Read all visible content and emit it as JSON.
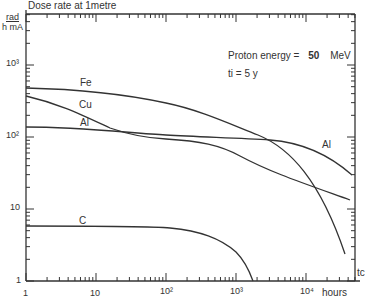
{
  "chart_data": {
    "type": "line",
    "ylabel_num": "rad",
    "ylabel_den": "h mA",
    "xlabel": "hours",
    "x_end_label": "t_c",
    "xscale": "log",
    "yscale": "log",
    "xlim": [
      1,
      40000
    ],
    "ylim": [
      1,
      2000
    ],
    "x_ticks": [
      "1",
      "10",
      "10^2",
      "10^3",
      "10^4"
    ],
    "y_ticks": [
      "1",
      "10",
      "10^2",
      "10^3"
    ],
    "annotations": [
      "Proton energy = 50 MeV",
      "t_i = 5 y"
    ],
    "series": [
      {
        "name": "Fe",
        "x": [
          1,
          10,
          100,
          1000,
          3000,
          10000,
          20000,
          35000
        ],
        "y": [
          480,
          440,
          330,
          170,
          110,
          55,
          15,
          2.5
        ]
      },
      {
        "name": "Cu",
        "x": [
          1,
          10,
          30,
          100,
          1000,
          3000,
          10000,
          20000,
          35000
        ],
        "y": [
          380,
          230,
          150,
          110,
          90,
          55,
          30,
          22,
          17
        ]
      },
      {
        "name": "Al",
        "x": [
          1,
          10,
          100,
          1000,
          3000,
          10000,
          20000,
          35000
        ],
        "y": [
          140,
          135,
          115,
          105,
          100,
          70,
          45,
          27
        ]
      },
      {
        "name": "C",
        "x": [
          1,
          10,
          100,
          500,
          1000,
          2000,
          2600
        ],
        "y": [
          6,
          6,
          5.8,
          4.5,
          3.2,
          1.6,
          1
        ]
      }
    ]
  },
  "labels": {
    "title": "Dose rate at 1metre",
    "ynum": "rad",
    "yden": "h mA",
    "y1000": "10³",
    "y100": "10²",
    "y10": "10",
    "y1": "1",
    "x1": "1",
    "x10": "10",
    "x100": "10²",
    "x1000": "10³",
    "x10000": "10⁴",
    "hours": "hours",
    "tc": "tc",
    "energy": "Proton energy =",
    "energy_val": "50",
    "energy_unit": "MeV",
    "ti": "ti  = 5 y",
    "fe": "Fe",
    "cu": "Cu",
    "al": "Al",
    "al2": "Al",
    "c": "C"
  }
}
